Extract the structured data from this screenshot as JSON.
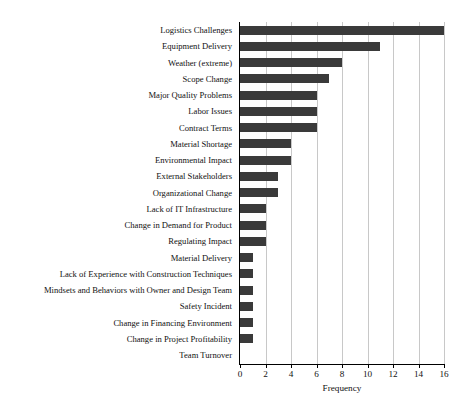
{
  "chart_data": {
    "type": "bar",
    "orientation": "horizontal",
    "title": "",
    "xlabel": "Frequency",
    "ylabel": "",
    "xlim": [
      0,
      16
    ],
    "xticks": [
      0,
      2,
      4,
      6,
      8,
      10,
      12,
      14,
      16
    ],
    "xtick_labels": [
      "0",
      "2",
      "4",
      "6",
      "8",
      "10",
      "12",
      "14",
      "16"
    ],
    "grid": "vertical",
    "legend": "none",
    "bar_color": "#3a3a3a",
    "categories": [
      "Logistics Challenges",
      "Equipment Delivery",
      "Weather (extreme)",
      "Scope Change",
      "Major Quality Problems",
      "Labor Issues",
      "Contract Terms",
      "Material Shortage",
      "Environmental Impact",
      "External Stakeholders",
      "Organizational Change",
      "Lack of IT Infrastructure",
      "Change in Demand for Product",
      "Regulating Impact",
      "Material Delivery",
      "Lack of Experience with Construction Techniques",
      "Mindsets and Behaviors with Owner and Design Team",
      "Safety Incident",
      "Change in Financing Environment",
      "Change in Project Profitability",
      "Team Turnover"
    ],
    "values": [
      16,
      11,
      8,
      7,
      6,
      6,
      6,
      4,
      4,
      3,
      3,
      2,
      2,
      2,
      1,
      1,
      1,
      1,
      1,
      1,
      0
    ]
  }
}
